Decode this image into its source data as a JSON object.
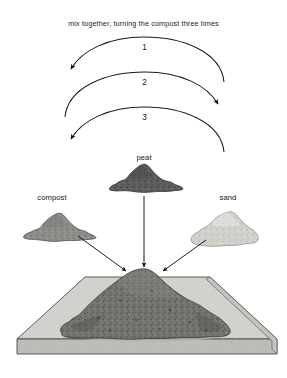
{
  "figure": {
    "title": "mix together, turning the compost three times",
    "background_color": "#ffffff",
    "ink_color": "#1c1c1c"
  },
  "turning_arcs": [
    {
      "number": "1",
      "direction": "right-to-left",
      "arrowhead": "left"
    },
    {
      "number": "2",
      "direction": "left-to-right",
      "arrowhead": "right"
    },
    {
      "number": "3",
      "direction": "right-to-left",
      "arrowhead": "left"
    }
  ],
  "ingredients": [
    {
      "label": "peat",
      "position": "top-center",
      "tone": "#595959",
      "shade": "dark"
    },
    {
      "label": "compost",
      "position": "middle-left",
      "tone": "#8a8a8a",
      "shade": "medium"
    },
    {
      "label": "sand",
      "position": "middle-right",
      "tone": "#cfcfcb",
      "shade": "light"
    }
  ],
  "flow_arrows": [
    {
      "from": "compost",
      "to": "mixed-pile",
      "orientation": "diagonal-down-right"
    },
    {
      "from": "peat",
      "to": "mixed-pile",
      "orientation": "vertical-down"
    },
    {
      "from": "sand",
      "to": "mixed-pile",
      "orientation": "diagonal-down-left"
    }
  ],
  "slab": {
    "name": "mixing-slab",
    "top_color": "#d0d0cc",
    "edge_color": "#b9b9b4",
    "outline_color": "#4a4a4a"
  },
  "mixed_pile": {
    "name": "mixed-compost-pile",
    "tone": "#6e6e6e"
  }
}
